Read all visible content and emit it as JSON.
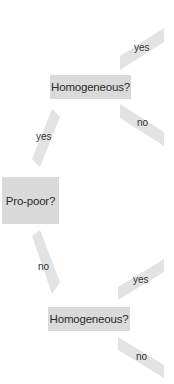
{
  "diagram": {
    "type": "decision-tree",
    "colors": {
      "node_fill": "#dadada",
      "arrow_fill": "#e3e3e3",
      "text": "#2a2a2a",
      "background": "#ffffff"
    },
    "nodes": {
      "root": {
        "label": "Pro-poor?"
      },
      "top": {
        "label": "Homogeneous?"
      },
      "bottom": {
        "label": "Homogeneous?"
      }
    },
    "edges": {
      "root_to_top": {
        "label": "yes"
      },
      "root_to_bottom": {
        "label": "no"
      },
      "top_yes": {
        "label": "yes"
      },
      "top_no": {
        "label": "no"
      },
      "bottom_yes": {
        "label": "yes"
      },
      "bottom_no": {
        "label": "no"
      }
    }
  }
}
